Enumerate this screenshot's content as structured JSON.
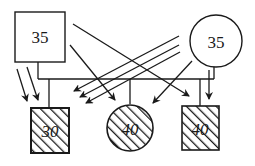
{
  "diagram": {
    "type": "pedigree",
    "parents": [
      {
        "id": "father",
        "shape": "square",
        "label": "35",
        "filled": false
      },
      {
        "id": "mother",
        "shape": "circle",
        "label": "35",
        "filled": false
      }
    ],
    "children": [
      {
        "id": "child-1",
        "shape": "square",
        "label": "30",
        "hatched": true
      },
      {
        "id": "child-2",
        "shape": "circle",
        "label": "40",
        "hatched": true
      },
      {
        "id": "child-3",
        "shape": "square",
        "label": "40",
        "hatched": true
      }
    ],
    "arrows": {
      "from_father": 4,
      "from_mother": 5
    },
    "colors": {
      "stroke": "#1a1a1a",
      "background": "#ffffff"
    }
  }
}
